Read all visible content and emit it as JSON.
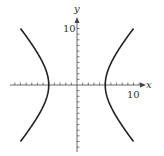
{
  "chart_data": {
    "type": "line",
    "title": "",
    "xlabel": "x",
    "ylabel": "y",
    "xlim": [
      -12,
      12
    ],
    "ylim": [
      -12,
      12
    ],
    "grid": false,
    "x_tick_label": "10",
    "y_tick_label": "10",
    "tick_step": 1,
    "equation": "x^2/25 - y^2/(100/3) = 1",
    "series": [
      {
        "name": "right branch",
        "x": [
          10,
          7.5,
          6,
          5,
          6,
          7.5,
          10
        ],
        "y": [
          10,
          6.45,
          3.83,
          0,
          -3.83,
          -6.45,
          -10
        ]
      },
      {
        "name": "left branch",
        "x": [
          -10,
          -7.5,
          -6,
          -5,
          -6,
          -7.5,
          -10
        ],
        "y": [
          10,
          6.45,
          3.83,
          0,
          -3.83,
          -6.45,
          -10
        ]
      }
    ]
  },
  "labels": {
    "x_axis": "x",
    "y_axis": "y",
    "x_ten": "10",
    "y_ten": "10"
  },
  "colors": {
    "curve": "#222222",
    "axis": "#444444"
  }
}
